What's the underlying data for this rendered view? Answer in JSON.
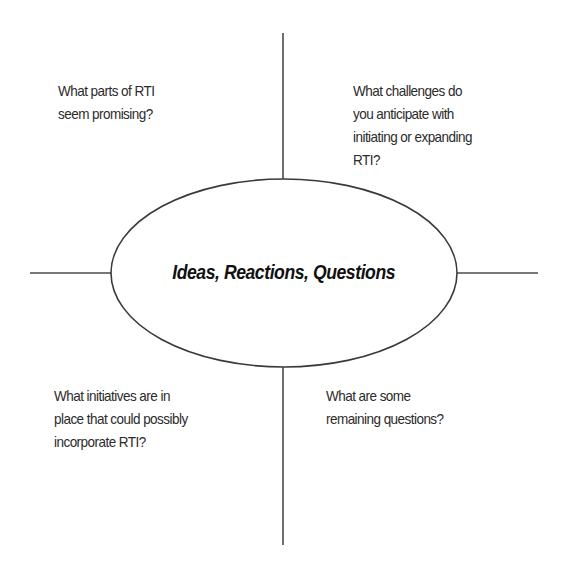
{
  "diagram": {
    "type": "graphic-organizer",
    "center": {
      "label": "Ideas, Reactions, Questions"
    },
    "quadrants": {
      "top_left": {
        "lines": [
          "What parts of RTI",
          "seem promising?"
        ]
      },
      "top_right": {
        "lines": [
          "What challenges do",
          "you anticipate with",
          "initiating or expanding",
          "RTI?"
        ]
      },
      "bottom_left": {
        "lines": [
          "What initiatives are in",
          "place that could possibly",
          "incorporate RTI?"
        ]
      },
      "bottom_right": {
        "lines": [
          "What are some",
          "remaining questions?"
        ]
      }
    },
    "colors": {
      "line": "#4a4a4a",
      "text": "#2b2b2b",
      "center_text": "#111111",
      "background": "#ffffff"
    }
  }
}
